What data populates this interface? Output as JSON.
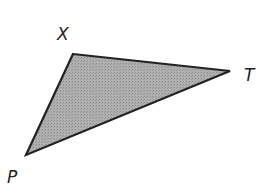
{
  "diagram": {
    "type": "triangle",
    "fill_color": "#a8a8a8",
    "stroke_color": "#222222",
    "vertices": [
      {
        "label": "X",
        "x": 73,
        "y": 54
      },
      {
        "label": "T",
        "x": 230,
        "y": 71
      },
      {
        "label": "P",
        "x": 26,
        "y": 155
      }
    ],
    "labels": {
      "x": "X",
      "t": "T",
      "p": "P"
    }
  }
}
